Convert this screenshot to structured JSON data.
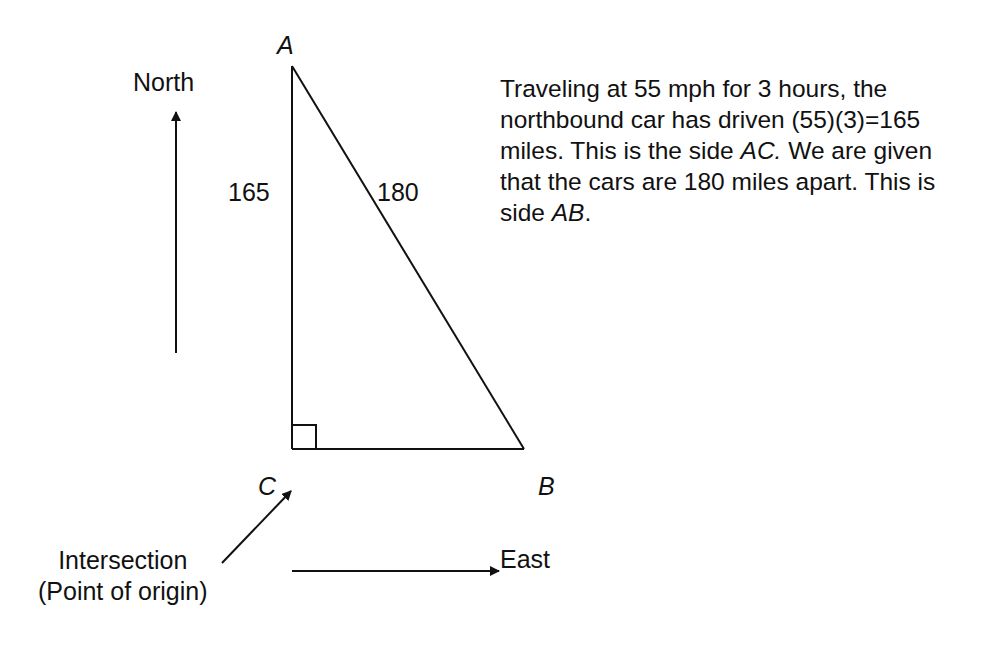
{
  "diagram": {
    "compass": {
      "north_label": "North",
      "east_label": "East"
    },
    "vertices": {
      "A": "A",
      "B": "B",
      "C": "C"
    },
    "sides": {
      "AC": "165",
      "AB": "180"
    },
    "origin": {
      "line1": "Intersection",
      "line2": "(Point of origin)"
    },
    "explanation": {
      "seg1": "Traveling at 55 mph for 3 hours, the northbound car has driven (55)(3)=165 miles.  This is the side ",
      "seg2": "AC.",
      "seg3": " We are given that the cars are 180 miles apart.  This is side ",
      "seg4": "AB",
      "seg5": "."
    },
    "colors": {
      "stroke": "#111111",
      "background": "#ffffff"
    }
  }
}
